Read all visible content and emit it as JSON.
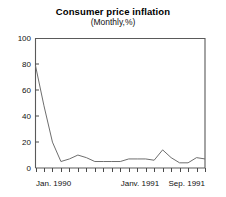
{
  "chart_data": {
    "type": "line",
    "title": "Consumer price inflation",
    "subtitle": "(Monthly,%)",
    "xlabel": "",
    "ylabel": "",
    "ylim": [
      0,
      100
    ],
    "yticks": [
      0,
      20,
      40,
      60,
      80,
      100
    ],
    "ytick_labels": [
      "0",
      "20",
      "40",
      "60",
      "80",
      "100"
    ],
    "grid": false,
    "legend": "none",
    "x_axis_tick_count": 21,
    "x_tick_labels": [
      {
        "index": 0,
        "label": "Jan. 1990"
      },
      {
        "index": 12,
        "label": "Janv. 1991"
      },
      {
        "index": 20,
        "label": "Sep. 1991"
      }
    ],
    "x": [
      "Jan. 1990",
      "Feb. 1990",
      "Mar. 1990",
      "Apr. 1990",
      "May 1990",
      "Jun. 1990",
      "Jul. 1990",
      "Aug. 1990",
      "Sep. 1990",
      "Oct. 1990",
      "Nov. 1990",
      "Dec. 1990",
      "Janv. 1991",
      "Feb. 1991",
      "Mar. 1991",
      "Apr. 1991",
      "May 1991",
      "Jun. 1991",
      "Jul. 1991",
      "Aug. 1991",
      "Sep. 1991"
    ],
    "values": [
      79,
      48,
      20,
      5,
      7,
      10,
      8,
      5,
      5,
      5,
      5,
      7,
      7,
      7,
      6,
      14,
      8,
      4,
      4,
      8,
      7
    ],
    "series": [
      {
        "name": "Consumer price inflation",
        "color": "#6e6e6e",
        "values": [
          79,
          48,
          20,
          5,
          7,
          10,
          8,
          5,
          5,
          5,
          5,
          7,
          7,
          7,
          6,
          14,
          8,
          4,
          4,
          8,
          7
        ]
      }
    ],
    "annotations": [
      "Steep disinflation from about 79% in Jan. 1990 to about 5% by Apr. 1990",
      "Secondary peak of about 14% around Apr. 1991"
    ]
  },
  "colors": {
    "line": "#6e6e6e",
    "frame": "#5a5a5a",
    "text": "#111111",
    "background": "#ffffff"
  }
}
